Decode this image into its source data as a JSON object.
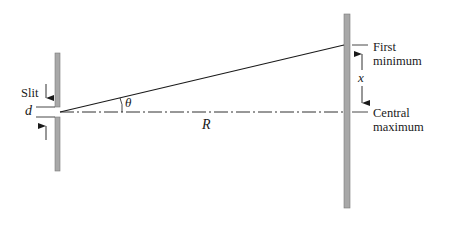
{
  "diagram": {
    "type": "single-slit diffraction geometry",
    "labels": {
      "slit": "Slit",
      "slit_width": "d",
      "angle": "θ",
      "distance": "R",
      "displacement": "x",
      "first_minimum_line1": "First",
      "first_minimum_line2": "minimum",
      "central_maximum_line1": "Central",
      "central_maximum_line2": "maximum"
    },
    "colors": {
      "barrier": "#a8a8a8",
      "barrier_edge": "#7a7a7a",
      "line": "#1a1a1a",
      "background": "#ffffff"
    }
  }
}
